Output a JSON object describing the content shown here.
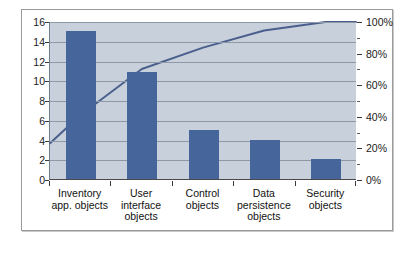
{
  "chart_data": {
    "type": "bar",
    "title": "",
    "subtitle": "",
    "xlabel": "",
    "ylabel": "",
    "categories": [
      "Inventory app. objects",
      "User interface objects",
      "Control objects",
      "Data persistence objects",
      "Security objects"
    ],
    "category_lines": [
      [
        "Inventory",
        "app. objects"
      ],
      [
        "User",
        "interface",
        "objects"
      ],
      [
        "Control",
        "objects"
      ],
      [
        "Data",
        "persistence",
        "objects"
      ],
      [
        "Security",
        "objects"
      ]
    ],
    "series": [
      {
        "name": "Count",
        "type": "bar",
        "axis": "left",
        "values": [
          15,
          10.8,
          5,
          4,
          2
        ],
        "color": "#46659a"
      },
      {
        "name": "Cumulative %",
        "type": "line",
        "axis": "right",
        "values": [
          40.8,
          70.1,
          83.7,
          94.6,
          100
        ],
        "color": "#4a5f8c"
      }
    ],
    "ylim": [
      0,
      16
    ],
    "yticks": [
      0,
      2,
      4,
      6,
      8,
      10,
      12,
      14,
      16
    ],
    "ytick_labels": [
      "0",
      "2",
      "4",
      "6",
      "8",
      "10",
      "12",
      "14",
      "16"
    ],
    "y2lim": [
      0,
      100
    ],
    "y2ticks": [
      0,
      20,
      40,
      60,
      80,
      100
    ],
    "y2tick_labels": [
      "0%",
      "20%",
      "40%",
      "60%",
      "80%",
      "100%"
    ],
    "grid": true,
    "legend": "none",
    "plot_background": "#c8d0dc",
    "figure_background": "#ffffff",
    "gridline_color": "#8e99a8"
  }
}
